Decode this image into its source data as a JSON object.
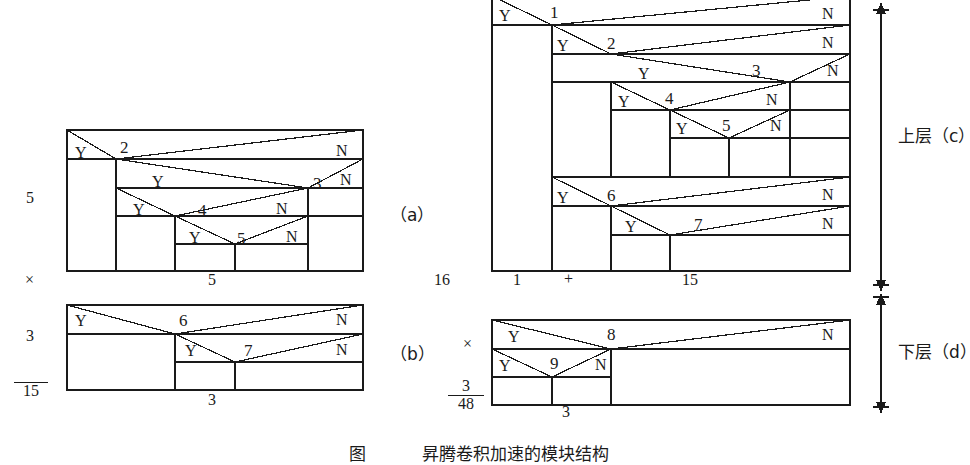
{
  "figure": {
    "caption": "图　 　　昇腾卷积加速的模块结构",
    "panels": [
      {
        "id": "a",
        "label": "（a）",
        "nodes": [
          "2",
          "3",
          "4",
          "5"
        ],
        "branch_yes": "Y",
        "branch_no": "N",
        "left_dim": "5",
        "bottom_dim": "5"
      },
      {
        "id": "b",
        "label": "（b）",
        "nodes": [
          "6",
          "7"
        ],
        "branch_yes": "Y",
        "branch_no": "N",
        "left_dim": "3",
        "bottom_dim": "3"
      },
      {
        "id": "c",
        "label": "上层（c）",
        "nodes": [
          "1",
          "2",
          "3",
          "4",
          "5",
          "6",
          "7"
        ],
        "branch_yes": "Y",
        "branch_no": "N",
        "left_dim": "16",
        "bottom_dims": [
          "1",
          "+",
          "15"
        ]
      },
      {
        "id": "d",
        "label": "下层（d）",
        "nodes": [
          "8",
          "9"
        ],
        "branch_yes": "Y",
        "branch_no": "N",
        "left_dim_num": "3",
        "left_dim_den": "48",
        "bottom_dim": "3"
      }
    ]
  },
  "left_fraction": {
    "num": "5",
    "times": "×",
    "den2": "3",
    "result": "15"
  },
  "right_fraction": {
    "num": "16",
    "times": "×",
    "den_num": "3",
    "den_den": "48"
  },
  "labels": {
    "panel_a": "（a）",
    "panel_b": "（b）",
    "upper_layer": "上层（c）",
    "lower_layer": "下层（d）",
    "multiply": "×",
    "plus": "+"
  },
  "nodes_a": [
    {
      "name": "2",
      "x": 126,
      "y": 148
    },
    {
      "name": "3",
      "x": 319,
      "y": 184
    },
    {
      "name": "4",
      "x": 204,
      "y": 211
    },
    {
      "name": "5",
      "x": 243,
      "y": 238
    }
  ],
  "nodes_b": [
    {
      "name": "6",
      "x": 185,
      "y": 321
    },
    {
      "name": "7",
      "x": 250,
      "y": 351
    }
  ],
  "nodes_c": [
    {
      "name": "1",
      "x": 556,
      "y": 14
    },
    {
      "name": "2",
      "x": 613,
      "y": 45
    },
    {
      "name": "3",
      "x": 758,
      "y": 72
    },
    {
      "name": "4",
      "x": 671,
      "y": 99
    },
    {
      "name": "5",
      "x": 728,
      "y": 125
    },
    {
      "name": "6",
      "x": 613,
      "y": 196
    },
    {
      "name": "7",
      "x": 700,
      "y": 225
    }
  ],
  "nodes_d": [
    {
      "name": "8",
      "x": 613,
      "y": 335
    },
    {
      "name": "9",
      "x": 556,
      "y": 364
    }
  ],
  "yes_labels_a": [
    {
      "t": "Y",
      "x": 80,
      "y": 155
    },
    {
      "t": "Y",
      "x": 157,
      "y": 183
    },
    {
      "t": "Y",
      "x": 138,
      "y": 211
    },
    {
      "t": "Y",
      "x": 194,
      "y": 240
    }
  ],
  "no_labels_a": [
    {
      "t": "N",
      "x": 341,
      "y": 152
    },
    {
      "t": "N",
      "x": 345,
      "y": 182
    },
    {
      "t": "N",
      "x": 281,
      "y": 211
    },
    {
      "t": "N",
      "x": 291,
      "y": 239
    }
  ],
  "yes_labels_b": [
    {
      "t": "Y",
      "x": 80,
      "y": 323
    },
    {
      "t": "Y",
      "x": 190,
      "y": 353
    }
  ],
  "no_labels_b": [
    {
      "t": "N",
      "x": 341,
      "y": 322
    },
    {
      "t": "N",
      "x": 341,
      "y": 352
    }
  ],
  "yes_labels_c": [
    {
      "t": "Y",
      "x": 504,
      "y": 18
    },
    {
      "t": "Y",
      "x": 562,
      "y": 48
    },
    {
      "t": "Y",
      "x": 643,
      "y": 76
    },
    {
      "t": "Y",
      "x": 623,
      "y": 103
    },
    {
      "t": "Y",
      "x": 681,
      "y": 130
    },
    {
      "t": "Y",
      "x": 562,
      "y": 199
    },
    {
      "t": "Y",
      "x": 630,
      "y": 229
    }
  ],
  "no_labels_c": [
    {
      "t": "N",
      "x": 827,
      "y": 16
    },
    {
      "t": "N",
      "x": 827,
      "y": 45
    },
    {
      "t": "N",
      "x": 832,
      "y": 73
    },
    {
      "t": "N",
      "x": 771,
      "y": 102
    },
    {
      "t": "N",
      "x": 775,
      "y": 128
    },
    {
      "t": "N",
      "x": 827,
      "y": 196
    },
    {
      "t": "N",
      "x": 827,
      "y": 226
    }
  ],
  "yes_labels_d": [
    {
      "t": "Y",
      "x": 513,
      "y": 338
    },
    {
      "t": "Y",
      "x": 504,
      "y": 367
    }
  ],
  "no_labels_d": [
    {
      "t": "N",
      "x": 827,
      "y": 336
    },
    {
      "t": "N",
      "x": 600,
      "y": 366
    }
  ],
  "dimension_texts": [
    {
      "t": "5",
      "x": 212,
      "y": 281
    },
    {
      "t": "3",
      "x": 212,
      "y": 400
    },
    {
      "t": "1",
      "x": 518,
      "y": 281
    },
    {
      "t": "+",
      "x": 570,
      "y": 281
    },
    {
      "t": "15",
      "x": 690,
      "y": 281
    },
    {
      "t": "3",
      "x": 566,
      "y": 410
    }
  ],
  "colors": {
    "ink": "#1a1a1a",
    "paper": "#ffffff"
  }
}
